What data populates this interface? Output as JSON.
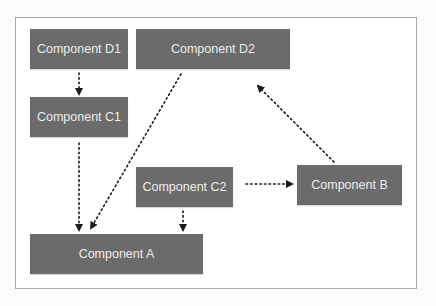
{
  "diagram": {
    "nodes": [
      {
        "id": "D1",
        "label": "Component D1",
        "x": 30,
        "y": 29,
        "w": 98,
        "h": 40
      },
      {
        "id": "D2",
        "label": "Component D2",
        "x": 136,
        "y": 29,
        "w": 154,
        "h": 40
      },
      {
        "id": "C1",
        "label": "Component C1",
        "x": 30,
        "y": 97,
        "w": 98,
        "h": 40
      },
      {
        "id": "C2",
        "label": "Component C2",
        "x": 136,
        "y": 167,
        "w": 97,
        "h": 40
      },
      {
        "id": "A",
        "label": "Component A",
        "x": 30,
        "y": 234,
        "w": 173,
        "h": 40
      },
      {
        "id": "B",
        "label": "Component B",
        "x": 297,
        "y": 165,
        "w": 105,
        "h": 40
      }
    ],
    "edges": [
      {
        "from": "D1",
        "to": "C1",
        "style": "dotted"
      },
      {
        "from": "C1",
        "to": "A",
        "style": "dotted"
      },
      {
        "from": "D2",
        "to": "A",
        "style": "dotted"
      },
      {
        "from": "C2",
        "to": "A",
        "style": "dotted"
      },
      {
        "from": "C2",
        "to": "B",
        "style": "dotted"
      },
      {
        "from": "B",
        "to": "D2",
        "style": "dotted"
      }
    ],
    "colors": {
      "node_fill": "#6b6b6b",
      "node_text": "#ececec",
      "edge": "#1a1a1a",
      "frame_border": "#a8a8a8"
    }
  }
}
